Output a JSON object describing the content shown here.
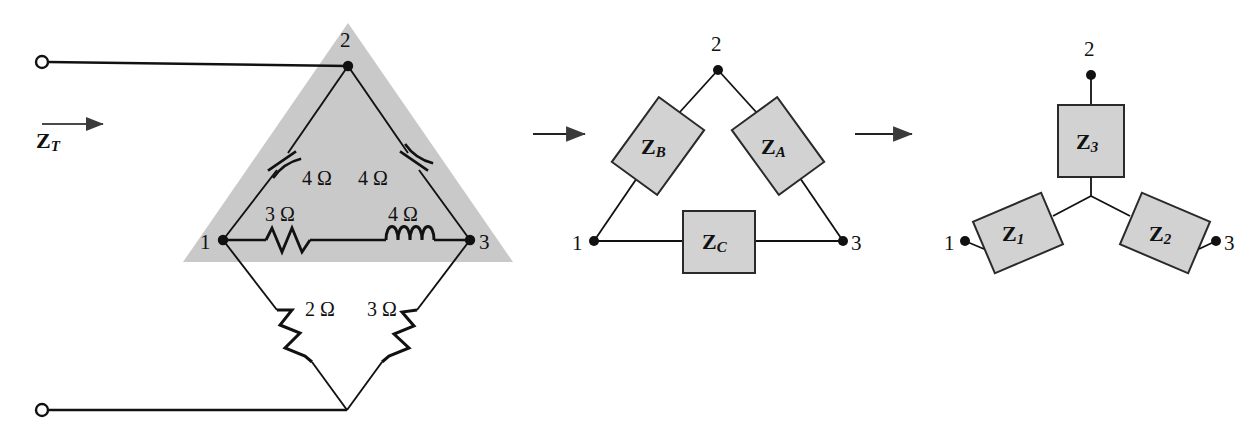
{
  "figure": {
    "background_color": "#ffffff",
    "line_color": "#111111",
    "shade_color": "#c9c9c9",
    "box_fill": "#d2d2d2",
    "box_stroke": "#2a2a2a"
  },
  "left_circuit": {
    "name": "bridge-network-with-delta-highlighted",
    "input_label": "Z",
    "input_label_sub": "T",
    "arrow": "right-arrow",
    "terminals": [
      {
        "name": "top-terminal",
        "shape": "open-circle"
      },
      {
        "name": "bottom-terminal",
        "shape": "open-circle"
      }
    ],
    "nodes": [
      {
        "id": "1",
        "label": "1"
      },
      {
        "id": "2",
        "label": "2"
      },
      {
        "id": "3",
        "label": "3"
      }
    ],
    "components": [
      {
        "name": "capacitor-1-2",
        "type": "capacitor",
        "value": "4 Ω",
        "between": [
          "1",
          "2"
        ]
      },
      {
        "name": "capacitor-2-3",
        "type": "capacitor",
        "value": "4 Ω",
        "between": [
          "2",
          "3"
        ]
      },
      {
        "name": "resistor-1-3",
        "type": "resistor",
        "value": "3 Ω",
        "between": [
          "1",
          "3"
        ]
      },
      {
        "name": "inductor-1-3",
        "type": "inductor",
        "value": "4 Ω",
        "between": [
          "1",
          "3"
        ]
      },
      {
        "name": "resistor-1-bottom",
        "type": "resistor",
        "value": "2 Ω",
        "between": [
          "1",
          "bottom"
        ]
      },
      {
        "name": "resistor-3-bottom",
        "type": "resistor",
        "value": "3 Ω",
        "between": [
          "3",
          "bottom"
        ]
      }
    ],
    "highlight": "shaded-triangle-delta-region"
  },
  "arrow_1": {
    "name": "transform-arrow-1",
    "glyph": "right-arrow"
  },
  "middle_circuit": {
    "name": "delta-network",
    "nodes": [
      {
        "id": "1",
        "label": "1"
      },
      {
        "id": "2",
        "label": "2"
      },
      {
        "id": "3",
        "label": "3"
      }
    ],
    "impedances": [
      {
        "name": "impedance-ZB",
        "letter": "Z",
        "sub": "B",
        "between": [
          "1",
          "2"
        ],
        "orientation": "tilted-left"
      },
      {
        "name": "impedance-ZA",
        "letter": "Z",
        "sub": "A",
        "between": [
          "2",
          "3"
        ],
        "orientation": "tilted-right"
      },
      {
        "name": "impedance-ZC",
        "letter": "Z",
        "sub": "C",
        "between": [
          "1",
          "3"
        ],
        "orientation": "horizontal"
      }
    ]
  },
  "arrow_2": {
    "name": "transform-arrow-2",
    "glyph": "right-arrow"
  },
  "right_circuit": {
    "name": "wye-network",
    "nodes": [
      {
        "id": "1",
        "label": "1"
      },
      {
        "id": "2",
        "label": "2"
      },
      {
        "id": "3",
        "label": "3"
      }
    ],
    "impedances": [
      {
        "name": "impedance-Z1",
        "letter": "Z",
        "sub": "1",
        "from": "1",
        "orientation": "tilted-left"
      },
      {
        "name": "impedance-Z2",
        "letter": "Z",
        "sub": "2",
        "from": "3",
        "orientation": "tilted-right"
      },
      {
        "name": "impedance-Z3",
        "letter": "Z",
        "sub": "3",
        "from": "2",
        "orientation": "vertical"
      }
    ],
    "center": "wye-center-junction"
  }
}
